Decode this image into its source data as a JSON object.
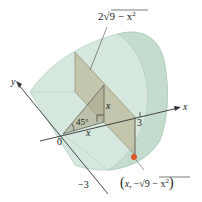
{
  "figure": {
    "labels": {
      "top_formula": "2√9 − x²",
      "top_formula_coef": "2",
      "top_formula_radicand": "9 − x",
      "top_formula_exp": "2",
      "y_axis": "y",
      "x_axis": "x",
      "origin": "0",
      "tick_3": "3",
      "tick_neg3": "−3",
      "angle": "45°",
      "height_x": "x",
      "base_x": "x",
      "point_label": "(x, −√9 − x²)",
      "point_open": "(",
      "point_x": "x,",
      "point_minus": "−",
      "point_radicand": "9 − x",
      "point_exp": "2",
      "point_close": ")"
    },
    "colors": {
      "solid_fill": "#cfe3d8",
      "solid_edge": "#a9c6b6",
      "section_fill": "#b9b59b",
      "axis": "#333333",
      "point": "#e0572b"
    }
  }
}
